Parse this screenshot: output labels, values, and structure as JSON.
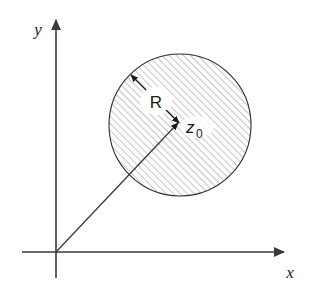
{
  "figure": {
    "background_color": "#ffffff",
    "width": 310,
    "height": 290
  },
  "axes": {
    "x_label": "x",
    "y_label": "y",
    "color": "#3a3a3a",
    "origin": {
      "x": 56,
      "y": 252
    },
    "x_axis": {
      "start_x": 22,
      "end_x": 288,
      "y": 252,
      "arrow": "right"
    },
    "y_axis": {
      "x": 56,
      "start_y": 278,
      "end_y": 16,
      "arrow": "up"
    }
  },
  "disk": {
    "center": {
      "x": 180,
      "y": 125
    },
    "radius": 71,
    "outline_color": "#2b2b2b",
    "hatch_color": "#8c8c8c",
    "hatch_angle_deg": 45,
    "hatch_spacing": 5,
    "fill": "hatched"
  },
  "annotations": {
    "radius_label": "R",
    "center_label_symbol": "z",
    "center_label_subscript": "0",
    "radius_arrow": {
      "type": "double-headed",
      "from": {
        "x": 131,
        "y": 75
      },
      "to": {
        "x": 178,
        "y": 122
      }
    },
    "position_vector": {
      "type": "single-headed",
      "from": {
        "x": 56,
        "y": 252
      },
      "to": {
        "x": 178,
        "y": 123
      },
      "color": "#3a3a3a"
    }
  }
}
